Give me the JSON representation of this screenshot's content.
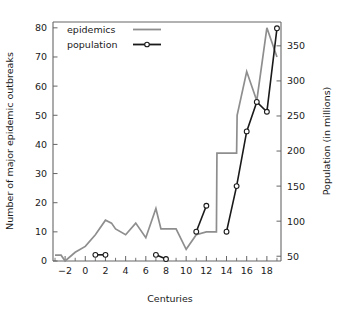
{
  "chart_data": {
    "type": "line",
    "title": "",
    "xlabel": "Centuries",
    "ylabel": "Number of major epidemic outbreaks",
    "y2label": "Population (in millions)",
    "xlim": [
      -3.2,
      19.4
    ],
    "ylim": [
      0,
      82
    ],
    "y2lim": [
      43.2,
      384
    ],
    "grid": false,
    "legend_position": "top-left",
    "xticks": [
      -2,
      0,
      2,
      4,
      6,
      8,
      10,
      12,
      14,
      16,
      18
    ],
    "xtick_labels": [
      "−2",
      "0",
      "2",
      "4",
      "6",
      "8",
      "10",
      "12",
      "14",
      "16",
      "18"
    ],
    "xticks_minor": [
      -3,
      -1,
      1,
      3,
      5,
      7,
      9,
      11,
      13,
      15,
      17,
      19
    ],
    "yticks": [
      0,
      10,
      20,
      30,
      40,
      50,
      60,
      70,
      80
    ],
    "ytick_labels": [
      "0",
      "10",
      "20",
      "30",
      "40",
      "50",
      "60",
      "70",
      "80"
    ],
    "y2ticks": [
      50,
      100,
      150,
      200,
      250,
      300,
      350
    ],
    "y2tick_labels": [
      "50",
      "100",
      "150",
      "200",
      "250",
      "300",
      "350"
    ],
    "series": [
      {
        "name": "epidemics",
        "axis": "left",
        "color": "#8e8e8e",
        "marker": "none",
        "x": [
          -3,
          -2.4,
          -2,
          -1,
          0,
          1,
          2,
          2.6,
          3,
          4,
          5,
          6,
          7,
          7.5,
          8,
          9,
          10,
          11,
          12,
          13,
          13.05,
          15,
          15.05,
          16,
          17,
          18,
          19
        ],
        "values": [
          2,
          2,
          0,
          3,
          5,
          9,
          14,
          13,
          11,
          9,
          13,
          8,
          18,
          11,
          11,
          11,
          4,
          9,
          10,
          10,
          37,
          37,
          50,
          65,
          55,
          80,
          70
        ]
      },
      {
        "name": "population",
        "axis": "right",
        "color": "#1a1a1a",
        "marker": "circle",
        "segments": [
          {
            "x": [
              1,
              2
            ],
            "values": [
              3,
              3
            ],
            "population": [
              52,
              52
            ]
          },
          {
            "x": [
              7,
              8
            ],
            "values": [
              3,
              1
            ],
            "population": [
              52,
              46
            ]
          },
          {
            "x": [
              11,
              12
            ],
            "values": [
              9,
              19
            ],
            "population": [
              85,
              122
            ]
          },
          {
            "x": [
              14,
              15,
              16,
              17,
              18,
              19
            ],
            "values": [
              9,
              25,
              45,
              54,
              51,
              79
            ],
            "population": [
              85,
              150,
              228,
              270,
              256,
              375
            ]
          }
        ]
      }
    ]
  },
  "legend": {
    "items": [
      {
        "label": "epidemics",
        "style": "line"
      },
      {
        "label": "population",
        "style": "line-marker"
      }
    ]
  },
  "axes": {
    "x_title": "Centuries",
    "y_left_title": "Number of major epidemic outbreaks",
    "y_right_title": "Population (in millions)"
  }
}
